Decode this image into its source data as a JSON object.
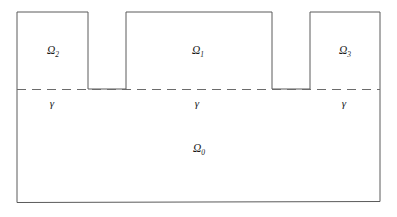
{
  "figure": {
    "kind": "domain-decomposition-diagram",
    "width": 397,
    "height": 217,
    "background_color": "#ffffff",
    "stroke_color": "#5a5a5a",
    "interface_stroke_color": "#6b6b6b",
    "label_color": "#1a1a1a"
  },
  "regions": [
    {
      "id": "omega2",
      "symbol": "Ω",
      "subscript": "2",
      "label": "Ω₂",
      "role": "left-tooth",
      "label_x": 53,
      "label_y": 54,
      "bounds": {
        "x_left": 17,
        "x_right": 88,
        "y_top": 12,
        "y_bottom": 89
      }
    },
    {
      "id": "omega1",
      "symbol": "Ω",
      "subscript": "1",
      "label": "Ω₁",
      "role": "center-tooth",
      "label_x": 198,
      "label_y": 54,
      "bounds": {
        "x_left": 126,
        "x_right": 272,
        "y_top": 12,
        "y_bottom": 89
      }
    },
    {
      "id": "omega3",
      "symbol": "Ω",
      "subscript": "3",
      "label": "Ω₃",
      "role": "right-tooth",
      "label_x": 345,
      "label_y": 54,
      "bounds": {
        "x_left": 310,
        "x_right": 380,
        "y_top": 12,
        "y_bottom": 89
      }
    },
    {
      "id": "omega0",
      "symbol": "Ω",
      "subscript": "0",
      "label": "Ω₀",
      "role": "base-substrate",
      "label_x": 199,
      "label_y": 152,
      "bounds": {
        "x_left": 17,
        "x_right": 380,
        "y_top": 89,
        "y_bottom": 202
      }
    }
  ],
  "interface": {
    "id": "gamma-interface",
    "symbol": "γ",
    "y": 89.5,
    "x_start": 17,
    "x_end": 380,
    "dash_pattern": "9 6",
    "labels": [
      {
        "id": "gamma-left",
        "text": "γ",
        "x": 52,
        "y": 107
      },
      {
        "id": "gamma-center",
        "text": "γ",
        "x": 197,
        "y": 107
      },
      {
        "id": "gamma-right",
        "text": "γ",
        "x": 344,
        "y": 107
      }
    ]
  },
  "outline": {
    "id": "domain-outline",
    "description": "comb-shaped outer boundary of the full domain",
    "path": "M 17 202 L 17 12 L 88 12 L 88 89 L 126 89 L 126 12 L 272 12 L 272 89 L 310 89 L 310 12 L 380 12 L 380 201 Z"
  },
  "notches": [
    {
      "id": "notch-left",
      "x_left": 88,
      "x_right": 126,
      "y_top": 89,
      "y_bottom": 12
    },
    {
      "id": "notch-right",
      "x_left": 272,
      "x_right": 310,
      "y_top": 89,
      "y_bottom": 12
    }
  ]
}
